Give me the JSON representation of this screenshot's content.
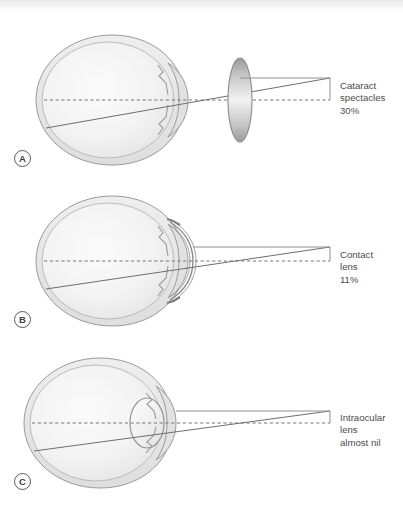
{
  "figure": {
    "background_color": "#ffffff",
    "stroke_color": "#8c8c8e",
    "sclera_fill": "#e8e8e8",
    "vitreous_fill": "#f4f4f4",
    "axis_style": "dashed"
  },
  "panels": [
    {
      "id": "A",
      "marker": "A",
      "correction": "Cataract spectacles",
      "magnification": "30%",
      "label_text": "Cataract\nspectacles\n30%",
      "lens_type": "spectacle-lens",
      "lens_position": "in front of eye"
    },
    {
      "id": "B",
      "marker": "B",
      "correction": "Contact lens",
      "magnification": "11%",
      "label_text": "Contact\nlens\n11%",
      "lens_type": "contact-lens",
      "lens_position": "on cornea"
    },
    {
      "id": "C",
      "marker": "C",
      "correction": "Intraocular lens",
      "magnification": "almost nil",
      "label_text": "Intraocular\nlens\nalmost nil",
      "lens_type": "intraocular-lens",
      "lens_position": "inside eye"
    }
  ]
}
